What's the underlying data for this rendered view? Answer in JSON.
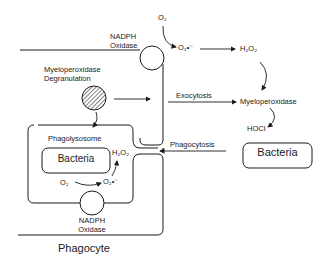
{
  "diagram": {
    "labels": {
      "o2_top": "O₂",
      "superoxide_top": "O₂•⁻",
      "h2o2_top": "H₂O₂",
      "nadph_top_line1": "NADPH",
      "nadph_top_line2": "Oxidase",
      "mpo_degran_line1": "Myeloperoxidase",
      "mpo_degran_line2": "Degranulation",
      "exocytosis": "Exocytosis",
      "myeloperoxidase": "Myeloperoxidase",
      "hocl": "HOCl",
      "phagolysosome": "Phagolysosome",
      "bacteria_inside": "Bacteria",
      "h2o2_inside": "H₂O₂",
      "o2_inside": "O₂",
      "superoxide_inside": "O₂•⁻",
      "nadph_bottom_line1": "NADPH",
      "nadph_bottom_line2": "Oxidase",
      "phagocytosis": "Phagocytosis",
      "bacteria_outside": "Bacteria",
      "phagocyte": "Phagocyte"
    },
    "colors": {
      "line": "#1a1a1a",
      "background": "#ffffff"
    }
  }
}
